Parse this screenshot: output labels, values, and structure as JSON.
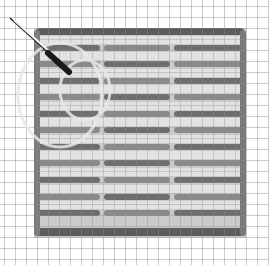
{
  "image": {
    "description": "Grayscale photo-like image of a woven mat on a square grid with a knife at top-left",
    "width": 269,
    "height": 265
  },
  "colors": {
    "background": "#ffffff",
    "grid_line": "#7a7a7a",
    "mat_fill": "#c9c9c9",
    "mat_light": "#dedede",
    "bar_dark": "#6e6e6e",
    "bar_mid": "#8a8a8a",
    "border_bar": "#5e5e5e",
    "knife_blade": "#cfcfcf",
    "knife_handle": "#1c1c1c"
  },
  "grid": {
    "spacing": 11,
    "origin_x": 4,
    "origin_y": 6
  },
  "mat": {
    "x": 34,
    "y": 28,
    "width": 212,
    "height": 210
  },
  "bars": {
    "rows_y": [
      48,
      64,
      81,
      97,
      114,
      130,
      147,
      163,
      180,
      197,
      213
    ],
    "segments_x": [
      [
        38,
        100
      ],
      [
        104,
        170
      ],
      [
        174,
        242
      ]
    ]
  },
  "knife": {
    "blade": {
      "x1": 10,
      "y1": 18,
      "x2": 50,
      "y2": 54
    },
    "handle": {
      "x1": 48,
      "y1": 52,
      "x2": 70,
      "y2": 72
    }
  },
  "caption": "Woven grid mat with knife"
}
